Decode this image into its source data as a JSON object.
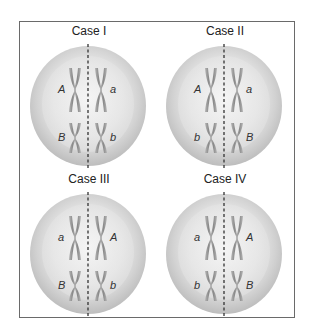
{
  "diagram": {
    "colors": {
      "frame_border": "#6a6a6a",
      "cell_outer": "#d4d4d4",
      "cell_inner": "#ececec",
      "chromosome": "#9a9a9a",
      "divider": "#333333",
      "text": "#222222"
    },
    "cases": [
      {
        "title": "Case I",
        "top_left": "A",
        "top_right": "a",
        "bottom_left": "B",
        "bottom_right": "b"
      },
      {
        "title": "Case II",
        "top_left": "A",
        "top_right": "a",
        "bottom_left": "b",
        "bottom_right": "B"
      },
      {
        "title": "Case III",
        "top_left": "a",
        "top_right": "A",
        "bottom_left": "B",
        "bottom_right": "b"
      },
      {
        "title": "Case IV",
        "top_left": "a",
        "top_right": "A",
        "bottom_left": "b",
        "bottom_right": "B"
      }
    ]
  }
}
